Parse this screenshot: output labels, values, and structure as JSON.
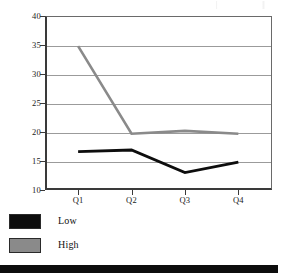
{
  "chart_data": {
    "type": "line",
    "title": "",
    "xlabel": "",
    "ylabel": "",
    "categories": [
      "Q1",
      "Q2",
      "Q3",
      "Q4"
    ],
    "ylim": [
      10,
      40
    ],
    "ytick_values": [
      40,
      35,
      30,
      25,
      20,
      15,
      10
    ],
    "ytick_labels": [
      "40",
      "35",
      "30",
      "25",
      "20",
      "15",
      "10"
    ],
    "grid": true,
    "legend_position": "below-left",
    "series": [
      {
        "name": "Low",
        "color": "#0d0d0d",
        "values": [
          16.6,
          16.9,
          13.0,
          14.8
        ]
      },
      {
        "name": "High",
        "color": "#8a8a8a",
        "values": [
          34.8,
          19.7,
          20.2,
          19.7
        ]
      }
    ]
  },
  "legend": {
    "items": [
      {
        "label": "Low",
        "color": "#0d0d0d"
      },
      {
        "label": "High",
        "color": "#8a8a8a"
      }
    ]
  },
  "colors": {
    "axis": "#3a3a3a",
    "gridline": "#9b9b9b",
    "low_series": "#0d0d0d",
    "high_series": "#8a8a8a",
    "bottom_rule": "#0d0d0d",
    "background": "#ffffff"
  }
}
